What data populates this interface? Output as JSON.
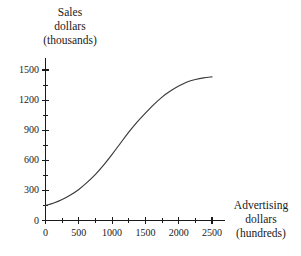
{
  "chart_data": {
    "type": "line",
    "title": "",
    "ylabel": "Sales dollars (thousands)",
    "ylabel_lines": [
      "Sales",
      "dollars",
      "(thousands)"
    ],
    "xlabel": "Advertising dollars (hundreds)",
    "xlabel_lines": [
      "Advertising",
      "dollars",
      "(hundreds)"
    ],
    "xlim": [
      0,
      2500
    ],
    "ylim": [
      0,
      1500
    ],
    "grid": false,
    "legend": null,
    "curve_color": "#3c3c3c",
    "axis_color": "#1a1a1a",
    "x_major_ticks": [
      0,
      500,
      1000,
      1500,
      2000,
      2500
    ],
    "x_minor_ticks": [
      250,
      750,
      1250,
      1750,
      2250
    ],
    "y_major_ticks": [
      0,
      300,
      600,
      900,
      1200,
      1500
    ],
    "y_minor_ticks": [
      150,
      450,
      750,
      1050,
      1350
    ],
    "x_tick_labels": [
      "0",
      "500",
      "1000",
      "1500",
      "2000",
      "2500"
    ],
    "y_tick_labels": [
      "0",
      "300",
      "600",
      "900",
      "1200",
      "1500"
    ],
    "series": [
      {
        "name": "Sales response to advertising",
        "shape": "sigmoid",
        "x": [
          0,
          125,
          250,
          375,
          500,
          625,
          750,
          875,
          1000,
          1125,
          1250,
          1375,
          1500,
          1625,
          1750,
          1875,
          2000,
          2125,
          2250,
          2375,
          2500
        ],
        "y": [
          150,
          175,
          210,
          255,
          310,
          380,
          460,
          555,
          660,
          770,
          880,
          980,
          1070,
          1155,
          1230,
          1290,
          1340,
          1380,
          1405,
          1422,
          1432
        ]
      }
    ]
  }
}
